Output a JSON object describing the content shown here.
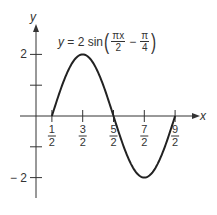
{
  "chart_data": {
    "type": "line",
    "equation": {
      "prefix": "y = 2 sin",
      "frac1_num": "πx",
      "frac1_den": "2",
      "minus": "−",
      "frac2_num": "π",
      "frac2_den": "4"
    },
    "xlabel": "x",
    "ylabel": "y",
    "x_ticks": [
      {
        "value": 0.5,
        "num": "1",
        "den": "2"
      },
      {
        "value": 1.5,
        "num": "3",
        "den": "2"
      },
      {
        "value": 2.5,
        "num": "5",
        "den": "2"
      },
      {
        "value": 3.5,
        "num": "7",
        "den": "2"
      },
      {
        "value": 4.5,
        "num": "9",
        "den": "2"
      }
    ],
    "y_ticks": [
      {
        "value": 2,
        "label": "2"
      },
      {
        "value": 1,
        "label": ""
      },
      {
        "value": -1,
        "label": ""
      },
      {
        "value": -2,
        "label": "− 2"
      }
    ],
    "x": [
      0.5,
      1.0,
      1.5,
      2.0,
      2.5,
      3.0,
      3.5,
      4.0,
      4.5
    ],
    "series": [
      {
        "name": "y = 2 sin(πx/2 − π/4)",
        "values": [
          0,
          1.414,
          2,
          1.414,
          0,
          -1.414,
          -2,
          -1.414,
          0
        ]
      }
    ],
    "xlim": [
      0,
      5
    ],
    "ylim": [
      -2.5,
      2.5
    ],
    "grid": false,
    "legend": "none"
  }
}
